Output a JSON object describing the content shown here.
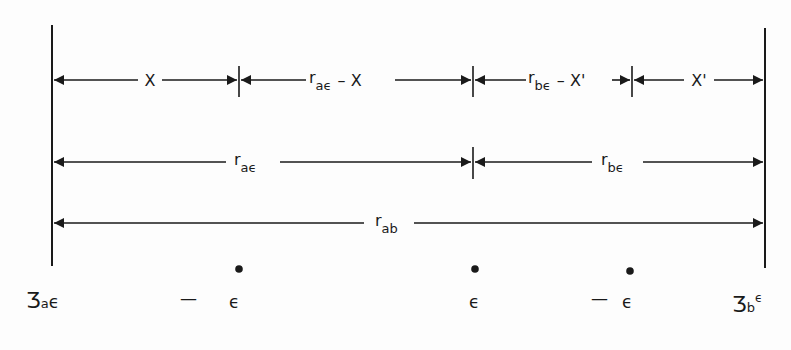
{
  "diagram": {
    "type": "distance-dimension-diagram",
    "boundaries": {
      "left": {
        "x": 52,
        "y1": 25,
        "y2": 266
      },
      "right": {
        "x": 765,
        "y1": 28,
        "y2": 268
      }
    },
    "ticks_x": [
      239,
      473,
      632
    ],
    "rows": [
      {
        "y": 80,
        "segments": [
          {
            "from": 52,
            "to": 239,
            "label": "X",
            "sub": ""
          },
          {
            "from": 239,
            "to": 473,
            "label": "r",
            "sub": "aϵ",
            "suffix": " – X"
          },
          {
            "from": 473,
            "to": 632,
            "label": "r",
            "sub": "bϵ",
            "suffix": " – X'"
          },
          {
            "from": 632,
            "to": 765,
            "label": "X'",
            "sub": ""
          }
        ]
      },
      {
        "y": 162,
        "segments": [
          {
            "from": 52,
            "to": 473,
            "label": "r",
            "sub": "aϵ"
          },
          {
            "from": 473,
            "to": 765,
            "label": "r",
            "sub": "bϵ"
          }
        ]
      },
      {
        "y": 223,
        "segments": [
          {
            "from": 52,
            "to": 765,
            "label": "r",
            "sub": "ab"
          }
        ]
      }
    ],
    "charges": [
      {
        "x": 52,
        "label": "Ʒ",
        "sub": "a",
        "tail": "ϵ",
        "dot": false
      },
      {
        "x": 239,
        "label": "—  ϵ",
        "dot": true
      },
      {
        "x": 473,
        "label": "ϵ",
        "dot": true
      },
      {
        "x": 632,
        "label": "—  ϵ",
        "dot": true
      },
      {
        "x": 765,
        "label": "Ʒ",
        "sub": "b",
        "sup": "ϵ",
        "dot": false
      }
    ]
  },
  "labels": {
    "row1_seg1": "X",
    "row1_seg2_main": "r",
    "row1_seg2_sub": "aϵ",
    "row1_seg2_rest": "– X",
    "row1_seg3_main": "r",
    "row1_seg3_sub": "bϵ",
    "row1_seg3_rest": "– X'",
    "row1_seg4": "X'",
    "row2_seg1_main": "r",
    "row2_seg1_sub": "aϵ",
    "row2_seg2_main": "r",
    "row2_seg2_sub": "bϵ",
    "row3_main": "r",
    "row3_sub": "ab",
    "charge_left_main": "Ʒ",
    "charge_left_sub": "a",
    "charge_left_tail": "ϵ",
    "charge_minus1": "—",
    "charge_eps1": "ϵ",
    "charge_eps_mid": "ϵ",
    "charge_minus2": "—",
    "charge_eps2": "ϵ",
    "charge_right_main": "Ʒ",
    "charge_right_sub": "b",
    "charge_right_sup": "ϵ"
  },
  "colors": {
    "ink": "#1a1a1a",
    "paper": "#fdfdfd"
  }
}
